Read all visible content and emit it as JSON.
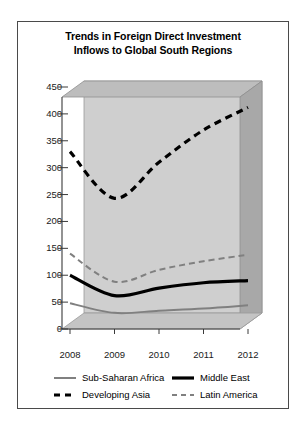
{
  "chart_data": {
    "type": "line",
    "title": "Trends in Foreign Direct Investment Inflows to Global South Regions",
    "title_line1": "Trends in Foreign Direct Investment",
    "title_line2": "Inflows to Global South Regions",
    "xlabel": "",
    "ylabel": "",
    "x": [
      "2008",
      "2009",
      "2010",
      "2011",
      "2012"
    ],
    "categories": [
      "2008",
      "2009",
      "2010",
      "2011",
      "2012"
    ],
    "ylim": [
      0,
      450
    ],
    "yticks": [
      0,
      50,
      100,
      150,
      200,
      250,
      300,
      350,
      400,
      450
    ],
    "ytick_labels": [
      "0",
      "50",
      "100",
      "150",
      "200",
      "250",
      "300",
      "350",
      "400",
      "450"
    ],
    "grid": false,
    "legend_position": "bottom",
    "style": "3d-wall",
    "series": [
      {
        "name": "Sub-Saharan Africa",
        "values": [
          48,
          30,
          34,
          38,
          44
        ],
        "color": "#808080",
        "line_style": "solid",
        "line_width": 2
      },
      {
        "name": "Middle East",
        "values": [
          100,
          62,
          76,
          86,
          90
        ],
        "color": "#000000",
        "line_style": "solid",
        "line_width": 3.2
      },
      {
        "name": "Developing Asia",
        "values": [
          330,
          243,
          310,
          370,
          412
        ],
        "color": "#000000",
        "line_style": "dashed",
        "line_width": 3.2
      },
      {
        "name": "Latin America",
        "values": [
          140,
          88,
          110,
          126,
          138
        ],
        "color": "#808080",
        "line_style": "dashed",
        "line_width": 2
      }
    ]
  },
  "legend": {
    "entries": [
      {
        "label": "Sub-Saharan Africa",
        "series_index": 0
      },
      {
        "label": "Middle East",
        "series_index": 1
      },
      {
        "label": "Developing Asia",
        "series_index": 2
      },
      {
        "label": "Latin America",
        "series_index": 3
      }
    ]
  },
  "colors": {
    "wall_back": "#cfcfcf",
    "wall_top": "#bdbdbd",
    "wall_side": "#a8a8a8",
    "floor": "#c4c4c4",
    "plot_face": "#ffffff",
    "frame_border": "#4a4a4a",
    "axis_line": "#3a3a3a",
    "text": "#000000"
  }
}
